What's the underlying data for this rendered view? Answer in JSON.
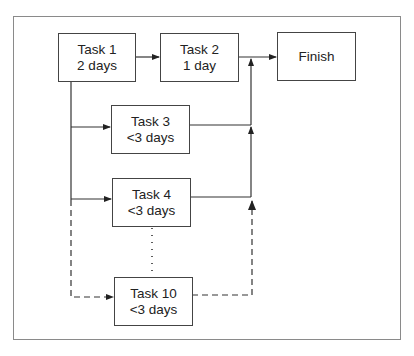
{
  "diagram": {
    "type": "task dependency / project network",
    "nodes": [
      {
        "id": "task1",
        "title": "Task 1",
        "duration": "2 days"
      },
      {
        "id": "task2",
        "title": "Task 2",
        "duration": "1 day"
      },
      {
        "id": "finish",
        "title": "Finish",
        "duration": ""
      },
      {
        "id": "task3",
        "title": "Task 3",
        "duration": "<3 days"
      },
      {
        "id": "task4",
        "title": "Task 4",
        "duration": "<3 days"
      },
      {
        "id": "task10",
        "title": "Task 10",
        "duration": "<3 days"
      }
    ],
    "edges": [
      {
        "from": "task1",
        "to": "task2",
        "style": "solid"
      },
      {
        "from": "task2",
        "to": "finish",
        "style": "solid"
      },
      {
        "from": "task1",
        "to": "task3",
        "style": "solid"
      },
      {
        "from": "task1",
        "to": "task4",
        "style": "solid"
      },
      {
        "from": "task1",
        "to": "task10",
        "style": "dashed"
      },
      {
        "from": "task3",
        "to": "finish",
        "style": "solid"
      },
      {
        "from": "task4",
        "to": "finish",
        "style": "solid"
      },
      {
        "from": "task10",
        "to": "finish",
        "style": "dashed"
      },
      {
        "from": "task4",
        "to": "task10",
        "style": "dotted",
        "meaning": "ellipsis (tasks 5-9)"
      }
    ],
    "colors": {
      "line": "#333333",
      "frame": "#8a8a8a",
      "background": "#ffffff"
    }
  }
}
